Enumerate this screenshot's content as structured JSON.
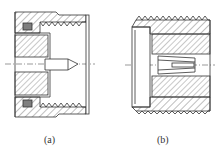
{
  "figure": {
    "type": "technical-cross-section",
    "line_color": "#333333",
    "background": "#ffffff",
    "panels": [
      {
        "id": "a",
        "label": "(a)",
        "parts": [
          "threaded-body",
          "o-ring-seal",
          "dielectric-insulator",
          "pin-contact",
          "centerline"
        ]
      },
      {
        "id": "b",
        "label": "(b)",
        "parts": [
          "threaded-body",
          "flange",
          "dielectric-insulator",
          "slotted-socket-contact",
          "centerline"
        ]
      }
    ]
  }
}
